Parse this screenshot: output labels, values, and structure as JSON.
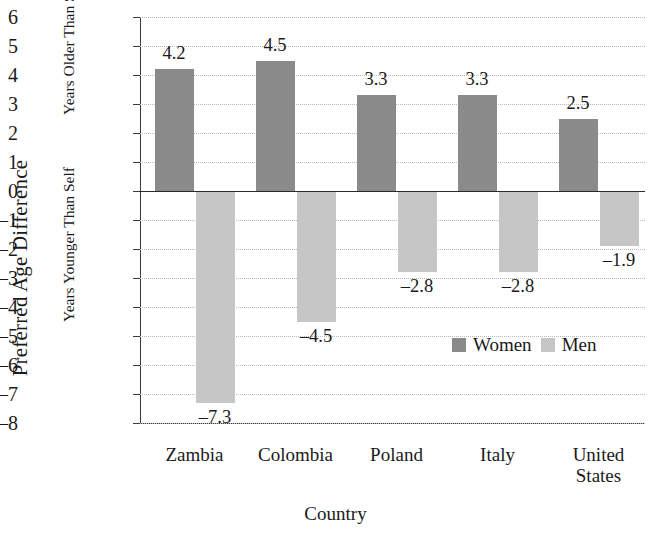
{
  "chart_data": {
    "type": "bar",
    "title": "",
    "xlabel": "Country",
    "ylabel": "Preferred Age Difference",
    "ylabel_upper": "Years Older Than Self",
    "ylabel_lower": "Years Younger Than Self",
    "categories": [
      "Zambia",
      "Colombia",
      "Poland",
      "Italy",
      "United States"
    ],
    "category_lines": [
      [
        "Zambia"
      ],
      [
        "Colombia"
      ],
      [
        "Poland"
      ],
      [
        "Italy"
      ],
      [
        "United",
        "States"
      ]
    ],
    "series": [
      {
        "name": "Women",
        "color": "#8a8a8a",
        "values": [
          4.2,
          4.5,
          3.3,
          3.3,
          2.5
        ],
        "labels": [
          "4.2",
          "4.5",
          "3.3",
          "3.3",
          "2.5"
        ]
      },
      {
        "name": "Men",
        "color": "#c6c6c6",
        "values": [
          -7.3,
          -4.5,
          -2.8,
          -2.8,
          -1.9
        ],
        "labels": [
          "–7.3",
          "–4.5",
          "–2.8",
          "–2.8",
          "–1.9"
        ]
      }
    ],
    "ylim": [
      -8,
      6
    ],
    "ytick_values": [
      6,
      5,
      4,
      3,
      2,
      1,
      0,
      -1,
      -2,
      -3,
      -4,
      -5,
      -6,
      -7,
      -8
    ],
    "ytick_labels": [
      "6",
      "5",
      "4",
      "3",
      "2",
      "1",
      "0",
      "–1",
      "–2",
      "–3",
      "–4",
      "–5",
      "–6",
      "–7",
      "–8"
    ],
    "grid": true,
    "legend_position": "inside-lower-right",
    "zero_line": true
  }
}
